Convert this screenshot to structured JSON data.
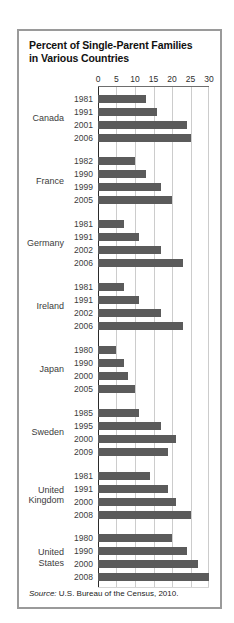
{
  "title": {
    "line1": "Percent of Single-Parent Families",
    "line2": "in Various Countries"
  },
  "source": {
    "label": "Source:",
    "text": " U.S. Bureau of the Census, 2010."
  },
  "chart_data": {
    "type": "bar",
    "orientation": "horizontal",
    "title": "Percent of Single-Parent Families in Various Countries",
    "xlabel": "Percent",
    "ylabel": "Country / Year",
    "xlim": [
      0,
      30
    ],
    "axis_ticks": [
      0,
      5,
      10,
      15,
      20,
      25,
      30
    ],
    "grid": true,
    "groups": [
      {
        "country": "Canada",
        "years": [
          "1981",
          "1991",
          "2001",
          "2006"
        ],
        "values": [
          13,
          16,
          24,
          25
        ]
      },
      {
        "country": "France",
        "years": [
          "1982",
          "1990",
          "1999",
          "2005"
        ],
        "values": [
          10,
          13,
          17,
          20
        ]
      },
      {
        "country": "Germany",
        "years": [
          "1981",
          "1991",
          "2002",
          "2006"
        ],
        "values": [
          7,
          11,
          17,
          23
        ]
      },
      {
        "country": "Ireland",
        "years": [
          "1981",
          "1991",
          "2002",
          "2006"
        ],
        "values": [
          7,
          11,
          17,
          23
        ]
      },
      {
        "country": "Japan",
        "years": [
          "1980",
          "1990",
          "2000",
          "2005"
        ],
        "values": [
          5,
          7,
          8,
          10
        ]
      },
      {
        "country": "Sweden",
        "years": [
          "1985",
          "1995",
          "2000",
          "2009"
        ],
        "values": [
          11,
          17,
          21,
          19
        ]
      },
      {
        "country": "United Kingdom",
        "years": [
          "1981",
          "1991",
          "2000",
          "2008"
        ],
        "values": [
          14,
          19,
          21,
          25
        ]
      },
      {
        "country": "United States",
        "years": [
          "1980",
          "1990",
          "2000",
          "2008"
        ],
        "values": [
          20,
          24,
          27,
          30
        ]
      }
    ],
    "colors": {
      "bar": "#5b5b5b",
      "gridline": "#cccccc",
      "axis_line": "#2b2b2b",
      "border": "#9a9a9a"
    }
  }
}
